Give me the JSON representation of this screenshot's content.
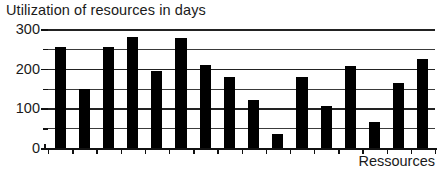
{
  "chart_data": {
    "type": "bar",
    "title": "Utilization of resources in days",
    "xlabel": "Ressources",
    "ylabel": "",
    "ylim": [
      0,
      300
    ],
    "grid": true,
    "legend": null,
    "y_ticks_major": [
      0,
      100,
      200,
      300
    ],
    "y_tick_labels": [
      "0",
      "100",
      "200",
      "300"
    ],
    "y_ticks_minor": [
      50,
      150,
      250
    ],
    "gridline_values": [
      50,
      100,
      150,
      200,
      250,
      300
    ],
    "categories": [
      "1",
      "2",
      "3",
      "4",
      "5",
      "6",
      "7",
      "8",
      "9",
      "10",
      "11",
      "12",
      "13",
      "14",
      "15",
      "16"
    ],
    "values": [
      255,
      150,
      255,
      280,
      195,
      278,
      210,
      178,
      122,
      35,
      180,
      105,
      208,
      65,
      165,
      225
    ],
    "bar_color": "#000000",
    "axis_color": "#111111",
    "grid_color": "#3a3a3a",
    "background_color": "#ffffff"
  }
}
